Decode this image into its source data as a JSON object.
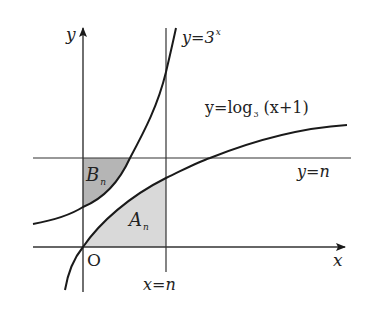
{
  "diagram": {
    "title": "",
    "axes": {
      "x_label": "x",
      "y_label": "y",
      "origin_label": "O"
    },
    "curves": [
      {
        "id": "exp",
        "label_prefix": "y=3",
        "label_exponent": "x",
        "equation": "y=3^x"
      },
      {
        "id": "log",
        "label_prefix": "y=log",
        "label_base": "3",
        "label_suffix": " (x+1)",
        "equation": "y=log_3(x+1)"
      }
    ],
    "lines": {
      "vertical": {
        "label": "x=n"
      },
      "horizontal": {
        "label": "y=n"
      }
    },
    "regions": {
      "A": {
        "letter": "A",
        "subscript": "n",
        "description": "region between y=log_3(x+1), x-axis and x=n"
      },
      "B": {
        "letter": "B",
        "subscript": "n",
        "description": "region between y=3^x, y-axis and y=n"
      }
    },
    "colors": {
      "line": "#1a1a1a",
      "axis": "#333333",
      "region_A": "#d9d9d9",
      "region_B": "#a8a8a8",
      "background": "#ffffff"
    }
  }
}
